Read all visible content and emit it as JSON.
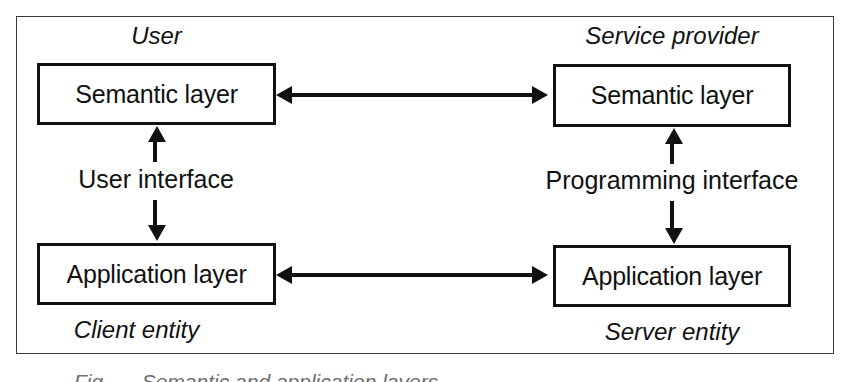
{
  "figure": {
    "background_color": "#ffffff",
    "line_color": "#111111",
    "frame_color": "#3a3a3a"
  },
  "captions": {
    "user": "User",
    "service_provider": "Service provider",
    "client_entity": "Client entity",
    "server_entity": "Server entity"
  },
  "boxes": {
    "user_semantic": "Semantic layer",
    "provider_semantic": "Semantic layer",
    "client_application": "Application layer",
    "server_application": "Application layer"
  },
  "interfaces": {
    "user_interface": "User interface",
    "programming_interface": "Programming interface"
  },
  "connectors": {
    "semantic_link": "bidirectional",
    "application_link": "bidirectional",
    "user_interface_link": "bidirectional",
    "programming_interface_link": "bidirectional"
  },
  "cropped_caption": "Fig. — Semantic and application layers"
}
